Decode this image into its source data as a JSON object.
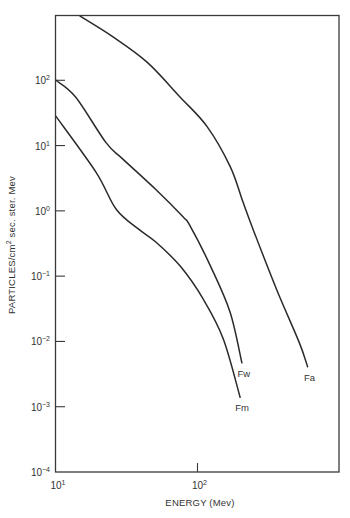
{
  "chart_data": {
    "type": "line",
    "title": "",
    "xlabel": "ENERGY (Mev)",
    "ylabel_main": "PARTICLES/cm",
    "ylabel_sup": "2",
    "ylabel_rest": " sec. ster. Mev",
    "ylabel": "PARTICLES/cm² sec. ster. Mev",
    "xscale": "log",
    "yscale": "log",
    "xlim": [
      10,
      1000
    ],
    "ylim": [
      0.0001,
      1000
    ],
    "grid": false,
    "legend": "inline labels at curve ends",
    "x_ticks": [
      {
        "value": 10,
        "base": "10",
        "exp": "1"
      },
      {
        "value": 100,
        "base": "10",
        "exp": "2"
      }
    ],
    "y_ticks": [
      {
        "value": 100,
        "base": "10",
        "exp": "2"
      },
      {
        "value": 10,
        "base": "10",
        "exp": "1"
      },
      {
        "value": 1,
        "base": "10",
        "exp": "0"
      },
      {
        "value": 0.1,
        "base": "10",
        "exp": "−1"
      },
      {
        "value": 0.01,
        "base": "10",
        "exp": "−2"
      },
      {
        "value": 0.001,
        "base": "10",
        "exp": "−3"
      },
      {
        "value": 0.0001,
        "base": "10",
        "exp": "−4"
      }
    ],
    "series": [
      {
        "name": "Fa",
        "points": [
          [
            14.8,
            960
          ],
          [
            25,
            470
          ],
          [
            44,
            190
          ],
          [
            75,
            56
          ],
          [
            117,
            19.5
          ],
          [
            170,
            4.8
          ],
          [
            210,
            1.35
          ],
          [
            247,
            0.52
          ],
          [
            363,
            0.062
          ],
          [
            525,
            0.0095
          ],
          [
            600,
            0.0041
          ]
        ]
      },
      {
        "name": "Fw",
        "points": [
          [
            10,
            100
          ],
          [
            13.8,
            55
          ],
          [
            22.5,
            11.2
          ],
          [
            29.7,
            6.2
          ],
          [
            51,
            2.1
          ],
          [
            79,
            0.81
          ],
          [
            89,
            0.58
          ],
          [
            124,
            0.14
          ],
          [
            170,
            0.028
          ],
          [
            206,
            0.0047
          ]
        ]
      },
      {
        "name": "Fm",
        "points": [
          [
            10,
            28
          ],
          [
            19.2,
            3.9
          ],
          [
            26.7,
            1.05
          ],
          [
            39,
            0.51
          ],
          [
            51,
            0.33
          ],
          [
            76,
            0.14
          ],
          [
            110,
            0.044
          ],
          [
            152,
            0.011
          ],
          [
            200,
            0.0014
          ]
        ]
      }
    ]
  }
}
